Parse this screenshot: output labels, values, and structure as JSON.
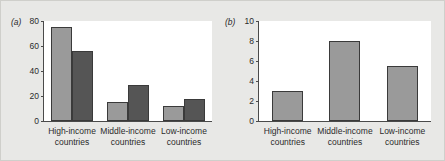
{
  "figure": {
    "background": "#e8e8e6",
    "plot_background": "#ffffff",
    "axis_color": "#4a4a4a"
  },
  "panel_a": {
    "tag": "(a)",
    "legend": {
      "series": [
        {
          "label": "Share of dutiable imports",
          "color": "#9a9a9a"
        },
        {
          "label": "Share of import duties paid",
          "color": "#555555"
        }
      ]
    },
    "yticks": [
      "80",
      "60",
      "40",
      "20",
      "0"
    ],
    "xlabels": [
      {
        "line1": "High-income",
        "line2": "countries"
      },
      {
        "line1": "Middle-income",
        "line2": "countries"
      },
      {
        "line1": "Low-income",
        "line2": "countries"
      }
    ]
  },
  "panel_b": {
    "tag": "(b)",
    "yticks": [
      "10",
      "8",
      "6",
      "4",
      "2",
      "0"
    ],
    "xlabels": [
      {
        "line1": "High-income",
        "line2": "countries"
      },
      {
        "line1": "Middle-income",
        "line2": "countries"
      },
      {
        "line1": "Low-income",
        "line2": "countries"
      }
    ]
  },
  "chart_data": [
    {
      "type": "bar",
      "panel": "(a)",
      "title": "",
      "xlabel": "",
      "ylabel": "",
      "ylim": [
        0,
        80
      ],
      "yticks": [
        0,
        20,
        40,
        60,
        80
      ],
      "grid": false,
      "legend_position": "top-right",
      "categories": [
        "High-income countries",
        "Middle-income countries",
        "Low-income countries"
      ],
      "series": [
        {
          "name": "Share of dutiable imports",
          "color": "#9a9a9a",
          "values": [
            75,
            15,
            12
          ]
        },
        {
          "name": "Share of import duties paid",
          "color": "#555555",
          "values": [
            56,
            29,
            17.5
          ]
        }
      ]
    },
    {
      "type": "bar",
      "panel": "(b)",
      "title": "",
      "xlabel": "",
      "ylabel": "",
      "ylim": [
        0,
        10
      ],
      "yticks": [
        0,
        2,
        4,
        6,
        8,
        10
      ],
      "grid": false,
      "legend_position": "none",
      "categories": [
        "High-income countries",
        "Middle-income countries",
        "Low-income countries"
      ],
      "values": [
        3.0,
        8.0,
        5.5
      ],
      "color": "#9a9a9a"
    }
  ]
}
